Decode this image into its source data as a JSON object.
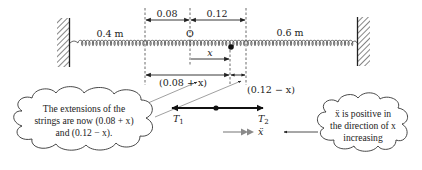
{
  "diagram": {
    "springs": {
      "left_length": "0.4 m",
      "right_length": "0.6 m"
    },
    "equilibrium_label": "O",
    "dimensions": {
      "left_extension": "0.08",
      "right_extension": "0.12",
      "displacement": "x",
      "new_left_extension": "(0.08 + x)",
      "new_right_extension": "(0.12 − x)"
    },
    "forces": {
      "t1": "T",
      "t1_sub": "1",
      "t2": "T",
      "t2_sub": "2",
      "acceleration": "ẍ"
    },
    "callouts": {
      "left": [
        "The extensions of the",
        "strings are now (0.08 + x)",
        "and (0.12 − x)."
      ],
      "right": [
        "ẍ is positive in",
        "the direction of x",
        "increasing"
      ]
    },
    "colors": {
      "line": "#222222",
      "acceleration_arrow": "#8a8a8a"
    }
  }
}
